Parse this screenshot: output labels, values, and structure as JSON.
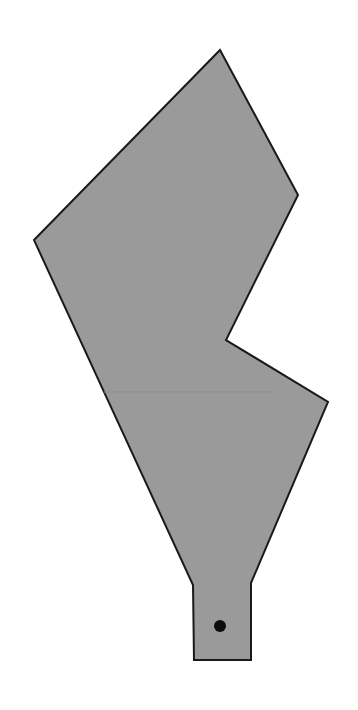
{
  "canvas": {
    "width": 358,
    "height": 710,
    "background_color": "#ffffff",
    "label": "shape-canvas"
  },
  "shape": {
    "name": "irregular-polygon-with-stem",
    "fill_color": "#9a9a9a",
    "stroke_color": "#1a1a1a",
    "stroke_width": 2,
    "points": "220,50 298,195 226,340 328,402 251,583 251,660 194,660 193,585 34,240",
    "vertices": [
      {
        "label": "top-apex",
        "x": 220,
        "y": 50
      },
      {
        "label": "right-upper-corner",
        "x": 298,
        "y": 195
      },
      {
        "label": "notch-concave-vertex",
        "x": 226,
        "y": 340
      },
      {
        "label": "right-lower-corner",
        "x": 328,
        "y": 402
      },
      {
        "label": "stem-right-shoulder",
        "x": 251,
        "y": 583
      },
      {
        "label": "stem-right-bottom",
        "x": 251,
        "y": 660
      },
      {
        "label": "stem-left-bottom",
        "x": 194,
        "y": 660
      },
      {
        "label": "stem-left-shoulder",
        "x": 193,
        "y": 585
      },
      {
        "label": "left-vertex",
        "x": 34,
        "y": 240
      }
    ]
  },
  "seam": {
    "name": "interior-seam-line",
    "color": "#8d8d8d",
    "width": 1,
    "x1": 104,
    "y1": 392,
    "x2": 275,
    "y2": 392
  },
  "marker": {
    "name": "hole-dot",
    "fill_color": "#0d0d0d",
    "cx": 220,
    "cy": 626,
    "r": 6
  }
}
